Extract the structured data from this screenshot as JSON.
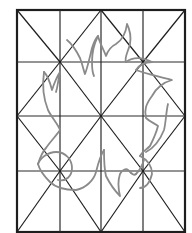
{
  "figure": {
    "grid": {
      "columns": 4,
      "rows": 4
    },
    "colors": {
      "background": "#ffffff",
      "grid_lines": "#1e1e1e",
      "motif_stroke": "#8a8a8a"
    },
    "motif": {
      "name": "flame-sun-outline",
      "style": "grey outline"
    }
  }
}
